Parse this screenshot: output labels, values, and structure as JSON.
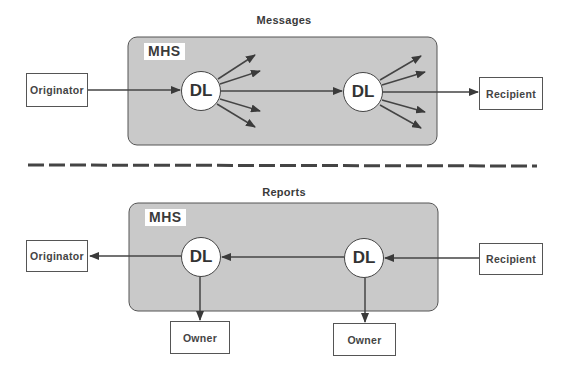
{
  "top_panel": {
    "title": "Messages",
    "mhs_label": "MHS",
    "dl1": "DL",
    "dl2": "DL",
    "originator": "Originator",
    "recipient": "Recipient"
  },
  "bottom_panel": {
    "title": "Reports",
    "mhs_label": "MHS",
    "dl1": "DL",
    "dl2": "DL",
    "originator": "Originator",
    "recipient": "Recipient",
    "owner1": "Owner",
    "owner2": "Owner"
  },
  "colors": {
    "mhs_fill": "#c9c9c9",
    "line": "#444444",
    "background": "#ffffff"
  }
}
